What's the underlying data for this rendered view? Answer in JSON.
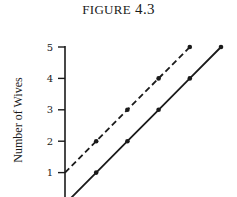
{
  "figure": {
    "title_word": "FIGURE",
    "title_number": "4.3"
  },
  "chart_data": {
    "type": "line",
    "title": "FIGURE 4.3",
    "xlabel": "",
    "ylabel": "Number of Wives",
    "ylim": [
      0,
      5
    ],
    "yticks": [
      1,
      2,
      3,
      4,
      5
    ],
    "grid": false,
    "legend": null,
    "series": [
      {
        "name": "dashed",
        "style": "dashed",
        "x": [
          0,
          1,
          2,
          3,
          4
        ],
        "values": [
          1,
          2,
          3,
          4,
          5
        ]
      },
      {
        "name": "solid",
        "style": "solid",
        "x": [
          1,
          2,
          3,
          4,
          5
        ],
        "values": [
          1,
          2,
          3,
          4,
          5
        ]
      }
    ]
  },
  "colors": {
    "ink": "#1a1a1a",
    "background": "#ffffff"
  }
}
